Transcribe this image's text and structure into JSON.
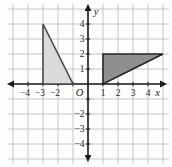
{
  "figure": {
    "type": "coordinate-grid-with-triangles",
    "unit_px": 15,
    "origin_px": {
      "x": 88,
      "y": 84
    },
    "canvas": {
      "width": 172,
      "height": 167
    },
    "grid": {
      "line_color": "#c6c6c6",
      "cols_from": -5,
      "cols_to": 5,
      "rows_from": -5,
      "rows_to": 5
    },
    "axes": {
      "color": "#1b1b1b",
      "x_label": "x",
      "y_label": "y",
      "origin_label": "O",
      "tick_values": [
        -4,
        -3,
        -2,
        -1,
        1,
        2,
        3,
        4
      ],
      "x_tick_labels": [
        {
          "value": -4,
          "label": "−4"
        },
        {
          "value": -3,
          "label": "−3"
        },
        {
          "value": -2,
          "label": "−2"
        },
        {
          "value": 1,
          "label": "1"
        },
        {
          "value": 2,
          "label": "2"
        },
        {
          "value": 3,
          "label": "3"
        },
        {
          "value": 4,
          "label": "4"
        }
      ],
      "y_tick_labels": [
        {
          "value": 4,
          "label": "4"
        },
        {
          "value": 3,
          "label": "3"
        },
        {
          "value": 2,
          "label": "2"
        },
        {
          "value": 1,
          "label": "1"
        },
        {
          "value": -2,
          "label": "−2"
        },
        {
          "value": -3,
          "label": "−3"
        },
        {
          "value": -4,
          "label": "−4"
        }
      ]
    },
    "shapes": [
      {
        "id": "light-triangle",
        "type": "polygon",
        "vertices": [
          [
            -3,
            4
          ],
          [
            -3,
            0
          ],
          [
            -1,
            0
          ]
        ],
        "fill": "#dbdbdb",
        "stroke": "#4a4a4a",
        "stroke_width": 1.6
      },
      {
        "id": "dark-triangle",
        "type": "polygon",
        "vertices": [
          [
            1,
            0
          ],
          [
            1,
            2
          ],
          [
            5,
            2
          ]
        ],
        "fill": "#8f8f8f",
        "stroke": "#242424",
        "stroke_width": 1.6
      }
    ],
    "text_color": "#2b2b2b"
  }
}
